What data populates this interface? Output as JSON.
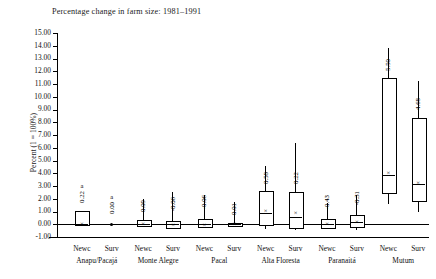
{
  "chart_data": {
    "type": "box",
    "title": "Percentage change in farm size: 1981–1991",
    "xlabel": "",
    "ylabel": "Percent (1 = 100%)",
    "ylim": [
      -1.0,
      15.0
    ],
    "ytick_step": 1.0,
    "grid": false,
    "legend": "none",
    "yticks": [
      "15.00",
      "14.00",
      "13.00",
      "12.00",
      "11.00",
      "10.00",
      "9.00",
      "8.00",
      "7.00",
      "6.00",
      "5.00",
      "4.00",
      "3.00",
      "2.00",
      "1.00",
      "0.00",
      "-1.00"
    ],
    "groups": [
      {
        "name": "Anapu/Pacajá",
        "categories": [
          "Newc",
          "Surv"
        ]
      },
      {
        "name": "Monte Alegre",
        "categories": [
          "Newc",
          "Surv"
        ]
      },
      {
        "name": "Pacal",
        "categories": [
          "Newc",
          "Surv"
        ]
      },
      {
        "name": "Alta Floresta",
        "categories": [
          "Newc",
          "Surv"
        ]
      },
      {
        "name": "Paranaitá",
        "categories": [
          "Newc",
          "Surv"
        ]
      },
      {
        "name": "Mutum",
        "categories": [
          "Newc",
          "Surv"
        ]
      }
    ],
    "categories": [
      "Newc",
      "Surv",
      "Newc",
      "Surv",
      "Newc",
      "Surv",
      "Newc",
      "Surv",
      "Newc",
      "Surv",
      "Newc",
      "Surv"
    ],
    "boxes": [
      {
        "group": "Anapu/Pacajá",
        "category": "Newc",
        "label": "0.22",
        "note": "a",
        "whisker_low": 0.0,
        "q1": 0.0,
        "median": 0.0,
        "mean": 0.05,
        "q3": 1.05,
        "whisker_high": 1.05
      },
      {
        "group": "Anapu/Pacajá",
        "category": "Surv",
        "label": "0.00",
        "note": "a",
        "whisker_low": 0.0,
        "q1": 0.0,
        "median": 0.0,
        "mean": 0.0,
        "q3": 0.0,
        "whisker_high": 0.0
      },
      {
        "group": "Monte Alegre",
        "category": "Newc",
        "label": "0.09",
        "note": "",
        "whisker_low": -0.15,
        "q1": -0.06,
        "median": 0.0,
        "mean": 0.0,
        "q3": 0.35,
        "whisker_high": 1.95
      },
      {
        "group": "Monte Alegre",
        "category": "Surv",
        "label": "-0.06",
        "note": "",
        "whisker_low": -0.3,
        "q1": -0.18,
        "median": 0.0,
        "mean": -0.05,
        "q3": 0.25,
        "whisker_high": 2.55
      },
      {
        "group": "Pacal",
        "category": "Newc",
        "label": "-0.06",
        "note": "",
        "whisker_low": -0.22,
        "q1": -0.14,
        "median": 0.0,
        "mean": -0.03,
        "q3": 0.42,
        "whisker_high": 2.3
      },
      {
        "group": "Pacal",
        "category": "Surv",
        "label": "0.01",
        "note": "",
        "whisker_low": -0.2,
        "q1": -0.08,
        "median": 0.0,
        "mean": 0.0,
        "q3": 0.12,
        "whisker_high": 1.75
      },
      {
        "group": "Alta Floresta",
        "category": "Newc",
        "label": "0.58",
        "note": "",
        "whisker_low": -0.4,
        "q1": 0.05,
        "median": 0.9,
        "mean": 1.05,
        "q3": 2.6,
        "whisker_high": 4.6
      },
      {
        "group": "Alta Floresta",
        "category": "Surv",
        "label": "0.22",
        "note": "",
        "whisker_low": -0.45,
        "q1": -0.2,
        "median": 0.6,
        "mean": 0.85,
        "q3": 2.55,
        "whisker_high": 6.4
      },
      {
        "group": "Paranaitá",
        "category": "Newc",
        "label": "-0.43",
        "note": "",
        "whisker_low": -0.4,
        "q1": -0.18,
        "median": 0.0,
        "mean": 0.0,
        "q3": 0.38,
        "whisker_high": 1.7
      },
      {
        "group": "Paranaitá",
        "category": "Surv",
        "label": "-0.31",
        "note": "",
        "whisker_low": -0.45,
        "q1": -0.15,
        "median": 0.2,
        "mean": 0.15,
        "q3": 0.7,
        "whisker_high": 2.3
      },
      {
        "group": "Mutum",
        "category": "Newc",
        "label": "5.50",
        "note": "",
        "whisker_low": 1.6,
        "q1": 2.55,
        "median": 3.9,
        "mean": 4.0,
        "q3": 11.45,
        "whisker_high": 13.85
      },
      {
        "group": "Mutum",
        "category": "Surv",
        "label": "4.68",
        "note": "",
        "whisker_low": 0.95,
        "q1": 1.9,
        "median": 3.15,
        "mean": 3.25,
        "q3": 8.35,
        "whisker_high": 11.2
      }
    ],
    "mean_marker_glyph": "×"
  }
}
